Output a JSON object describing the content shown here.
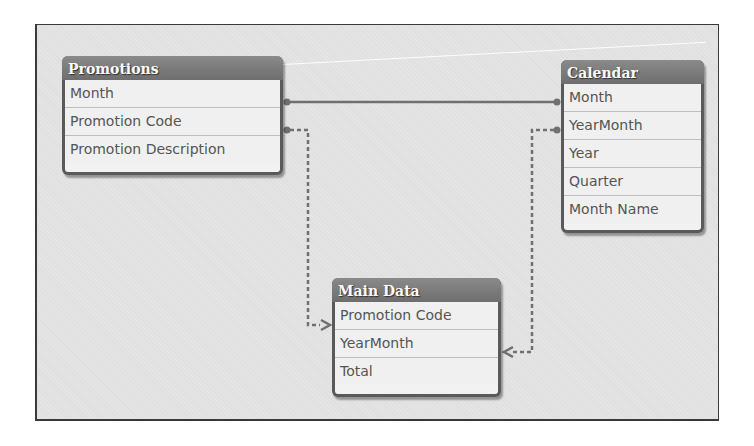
{
  "diagram": {
    "tables": {
      "promotions": {
        "title": "Promotions",
        "fields": [
          "Month",
          "Promotion Code",
          "Promotion Description"
        ]
      },
      "calendar": {
        "title": "Calendar",
        "fields": [
          "Month",
          "YearMonth",
          "Year",
          "Quarter",
          "Month Name"
        ]
      },
      "main_data": {
        "title": "Main Data",
        "fields": [
          "Promotion Code",
          "YearMonth",
          "Total"
        ]
      }
    },
    "links": [
      {
        "from": "Promotions.Month",
        "to": "Calendar.Month",
        "style": "solid"
      },
      {
        "from": "Promotions.Promotion Code",
        "to": "Main Data.Promotion Code",
        "style": "dashed"
      },
      {
        "from": "Calendar.YearMonth",
        "to": "Main Data.YearMonth",
        "style": "dashed"
      }
    ],
    "colors": {
      "header": "#757575",
      "line": "#6e6e6e",
      "background": "#e4e4e4"
    }
  }
}
